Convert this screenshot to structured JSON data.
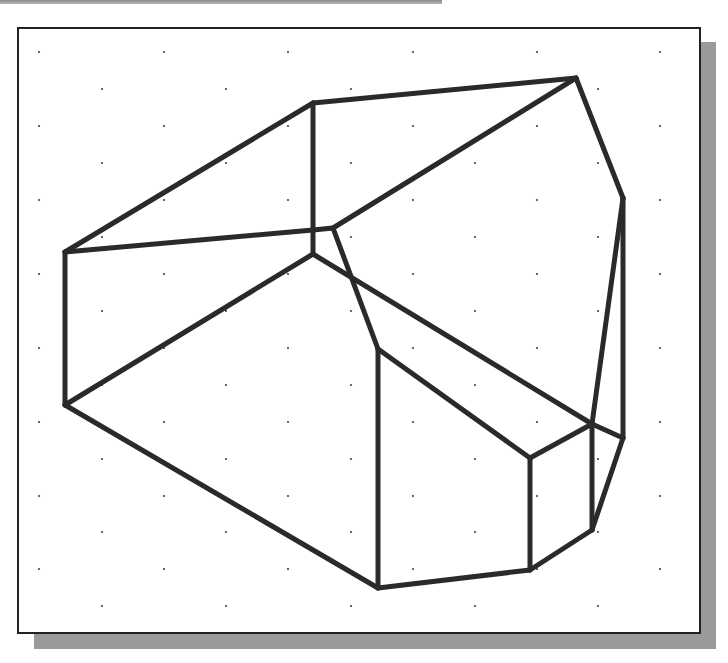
{
  "figure": {
    "line_color": "#2a2a2a",
    "dot_color": "#444444",
    "frame_border_color": "#222222",
    "shadow_color": "#9a9a9a"
  },
  "grid": {
    "rows_y": [
      52,
      89,
      126,
      163,
      200,
      237,
      274,
      311,
      348,
      385,
      422,
      459,
      496,
      532,
      569,
      606
    ],
    "even_row_x": [
      39,
      164,
      288,
      413,
      537,
      660
    ],
    "odd_row_x": [
      102,
      226,
      351,
      475,
      598
    ]
  },
  "vertices": {
    "A": [
      65,
      252
    ],
    "B": [
      65,
      405
    ],
    "C": [
      313,
      103
    ],
    "D": [
      576,
      78
    ],
    "E": [
      623,
      198
    ],
    "F": [
      623,
      438
    ],
    "G": [
      313,
      230
    ],
    "H": [
      333,
      228
    ],
    "I": [
      313,
      254
    ],
    "J": [
      378,
      349
    ],
    "K": [
      378,
      588
    ],
    "L": [
      530,
      458
    ],
    "M": [
      530,
      570
    ],
    "N": [
      592,
      424
    ],
    "O": [
      592,
      530
    ]
  },
  "edges": [
    [
      "A",
      "C"
    ],
    [
      "C",
      "D"
    ],
    [
      "D",
      "E"
    ],
    [
      "E",
      "F"
    ],
    [
      "A",
      "B"
    ],
    [
      "A",
      "G"
    ],
    [
      "G",
      "H"
    ],
    [
      "C",
      "I"
    ],
    [
      "D",
      "H"
    ],
    [
      "H",
      "J"
    ],
    [
      "B",
      "I"
    ],
    [
      "I",
      "N"
    ],
    [
      "N",
      "F"
    ],
    [
      "E",
      "N"
    ],
    [
      "B",
      "K"
    ],
    [
      "J",
      "K"
    ],
    [
      "J",
      "L"
    ],
    [
      "L",
      "N"
    ],
    [
      "L",
      "M"
    ],
    [
      "K",
      "M"
    ],
    [
      "M",
      "O"
    ],
    [
      "N",
      "O"
    ],
    [
      "F",
      "O"
    ]
  ]
}
